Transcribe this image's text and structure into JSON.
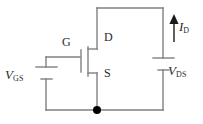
{
  "figure": {
    "stroke_color": "#808080",
    "node_color": "#000000",
    "text_color": "#2b2b2b",
    "background": "#ffffff",
    "width": 203,
    "height": 124
  },
  "labels": {
    "vgs": {
      "symbol": "V",
      "subscript": "GS"
    },
    "vds": {
      "symbol": "V",
      "subscript": "DS"
    },
    "id": {
      "symbol": "I",
      "subscript": "D"
    },
    "gate": "G",
    "drain": "D",
    "source": "S"
  },
  "components": [
    {
      "name": "mosfet",
      "type": "n-channel-mosfet",
      "terminals": [
        "G",
        "D",
        "S"
      ]
    },
    {
      "name": "gate-source-battery",
      "type": "dc-voltage-source",
      "label": "VGS"
    },
    {
      "name": "drain-source-battery",
      "type": "dc-voltage-source",
      "label": "VDS"
    },
    {
      "name": "drain-current-arrow",
      "type": "current-arrow",
      "label": "ID",
      "direction": "up"
    },
    {
      "name": "ground-node",
      "type": "junction-dot"
    }
  ]
}
